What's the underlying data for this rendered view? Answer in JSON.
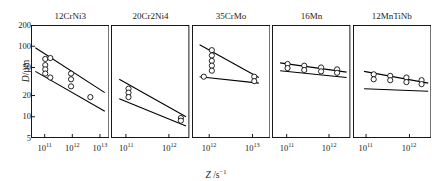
{
  "figure": {
    "ylabel_symbol": "D",
    "ylabel_unit": "/μm",
    "xlabel_symbol": "Z",
    "xlabel_unit": " /s",
    "xlabel_exponent": "−1",
    "y_ticks": [
      "200",
      "100",
      "50",
      "20",
      "10",
      "5"
    ],
    "y_tick_values": [
      200,
      100,
      50,
      20,
      10,
      5
    ],
    "ylim": [
      5,
      200
    ],
    "axis_scale": "log-log",
    "grid": "off",
    "legend": "none",
    "line_color": "#000000",
    "marker_color": "#ffffff",
    "marker_edge_color": "#000000",
    "frame_color": "#000000"
  },
  "chart_data": {
    "type": "scatter",
    "title": "",
    "xlabel": "Z /s⁻¹",
    "ylabel": "D/μm",
    "ylim": [
      5,
      200
    ],
    "ylog": true,
    "xlog": true,
    "grid": false,
    "legend_position": "none",
    "panels": [
      {
        "name": "12CrNi3",
        "xlim": [
          32000000000.0,
          22000000000000.0
        ],
        "x_ticks": [
          100000000000.0,
          1000000000000.0,
          10000000000000.0
        ],
        "x_tick_labels": [
          "10",
          "10",
          "10"
        ],
        "x_tick_exponents": [
          "11",
          "12",
          "13"
        ],
        "points": [
          {
            "x": 105000000000.0,
            "y": 66
          },
          {
            "x": 105000000000.0,
            "y": 54
          },
          {
            "x": 105000000000.0,
            "y": 47
          },
          {
            "x": 105000000000.0,
            "y": 41
          },
          {
            "x": 160000000000.0,
            "y": 68
          },
          {
            "x": 160000000000.0,
            "y": 36
          },
          {
            "x": 900000000000.0,
            "y": 41
          },
          {
            "x": 900000000000.0,
            "y": 34
          },
          {
            "x": 900000000000.0,
            "y": 27
          },
          {
            "x": 4500000000000.0,
            "y": 19
          }
        ],
        "upper_line": {
          "x": [
            46000000000.0,
            15000000000000.0
          ],
          "y": [
            95,
            22
          ]
        },
        "lower_line": {
          "x": [
            46000000000.0,
            15000000000000.0
          ],
          "y": [
            44,
            12
          ]
        }
      },
      {
        "name": "20Cr2Ni4",
        "xlim": [
          45000000000.0,
          3000000000000.0
        ],
        "x_ticks": [
          100000000000.0,
          1000000000000.0
        ],
        "x_tick_labels": [
          "10",
          "10"
        ],
        "x_tick_exponents": [
          "11",
          "12"
        ],
        "points": [
          {
            "x": 115000000000.0,
            "y": 25
          },
          {
            "x": 115000000000.0,
            "y": 22
          },
          {
            "x": 115000000000.0,
            "y": 19
          },
          {
            "x": 1900000000000.0,
            "y": 9.6
          },
          {
            "x": 1900000000000.0,
            "y": 8.8
          }
        ],
        "upper_line": {
          "x": [
            70000000000.0,
            2500000000000.0
          ],
          "y": [
            34,
            10
          ]
        },
        "lower_line": {
          "x": [
            70000000000.0,
            2500000000000.0
          ],
          "y": [
            18,
            7.4
          ]
        }
      },
      {
        "name": "35CrMo",
        "xlim": [
          400000000000.0,
          26000000000000.0
        ],
        "x_ticks": [
          1000000000000.0,
          10000000000000.0
        ],
        "x_tick_labels": [
          "10",
          "10"
        ],
        "x_tick_exponents": [
          "12",
          "13"
        ],
        "points": [
          {
            "x": 1150000000000.0,
            "y": 88
          },
          {
            "x": 1150000000000.0,
            "y": 74
          },
          {
            "x": 1150000000000.0,
            "y": 62
          },
          {
            "x": 1150000000000.0,
            "y": 53
          },
          {
            "x": 1150000000000.0,
            "y": 45
          },
          {
            "x": 750000000000.0,
            "y": 37
          },
          {
            "x": 11000000000000.0,
            "y": 37
          },
          {
            "x": 11000000000000.0,
            "y": 32
          }
        ],
        "upper_line": {
          "x": [
            600000000000.0,
            14000000000000.0
          ],
          "y": [
            105,
            36
          ]
        },
        "lower_line": {
          "x": [
            600000000000.0,
            14000000000000.0
          ],
          "y": [
            37,
            30
          ]
        }
      },
      {
        "name": "16Mn",
        "xlim": [
          45000000000.0,
          3200000000000.0
        ],
        "x_ticks": [
          100000000000.0,
          1000000000000.0
        ],
        "x_tick_labels": [
          "10",
          "10"
        ],
        "x_tick_exponents": [
          "11",
          "12"
        ],
        "points": [
          {
            "x": 105000000000.0,
            "y": 56
          },
          {
            "x": 105000000000.0,
            "y": 49
          },
          {
            "x": 260000000000.0,
            "y": 53
          },
          {
            "x": 260000000000.0,
            "y": 46
          },
          {
            "x": 650000000000.0,
            "y": 50
          },
          {
            "x": 650000000000.0,
            "y": 44
          },
          {
            "x": 1550000000000.0,
            "y": 47
          },
          {
            "x": 1550000000000.0,
            "y": 42
          }
        ],
        "upper_line": {
          "x": [
            70000000000.0,
            2600000000000.0
          ],
          "y": [
            58,
            43
          ]
        },
        "lower_line": {
          "x": [
            70000000000.0,
            2600000000000.0
          ],
          "y": [
            45,
            36
          ]
        }
      },
      {
        "name": "12MnTiNb",
        "xlim": [
          50000000000.0,
          3200000000000.0
        ],
        "x_ticks": [
          100000000000.0,
          1000000000000.0
        ],
        "x_tick_labels": [
          "10",
          "10"
        ],
        "x_tick_exponents": [
          "11",
          "12"
        ],
        "points": [
          {
            "x": 150000000000.0,
            "y": 40
          },
          {
            "x": 150000000000.0,
            "y": 34
          },
          {
            "x": 360000000000.0,
            "y": 38
          },
          {
            "x": 360000000000.0,
            "y": 33
          },
          {
            "x": 850000000000.0,
            "y": 36
          },
          {
            "x": 850000000000.0,
            "y": 31
          },
          {
            "x": 1900000000000.0,
            "y": 33
          },
          {
            "x": 1900000000000.0,
            "y": 29
          }
        ],
        "upper_line": {
          "x": [
            90000000000.0,
            2700000000000.0
          ],
          "y": [
            44,
            30
          ]
        },
        "lower_line": {
          "x": [
            90000000000.0,
            2700000000000.0
          ],
          "y": [
            25,
            23
          ]
        }
      }
    ]
  }
}
